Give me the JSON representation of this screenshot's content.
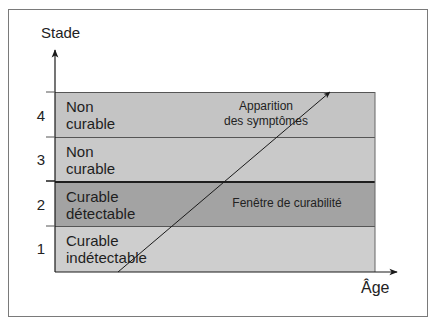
{
  "diagram": {
    "y_axis": {
      "title": "Stade",
      "ticks": [
        "4",
        "3",
        "2",
        "1"
      ]
    },
    "x_axis": {
      "title": "Âge"
    },
    "bands": [
      {
        "stage": "4",
        "line1": "Non",
        "line2": "curable",
        "color": "#c4c4c4"
      },
      {
        "stage": "3",
        "line1": "Non",
        "line2": "curable",
        "color": "#c8c8c8"
      },
      {
        "stage": "2",
        "line1": "Curable",
        "line2": "détectable",
        "color": "#a3a3a3"
      },
      {
        "stage": "1",
        "line1": "Curable",
        "line2": "indétectable",
        "color": "#cdcdcd"
      }
    ],
    "annotations": {
      "symptoms_line1": "Apparition",
      "symptoms_line2": "des symptômes",
      "window": "Fenêtre de curabilité"
    },
    "colors": {
      "frame": "#7a7a7a",
      "axis": "#1a1a1a",
      "band_border": "#2a2a2a"
    }
  }
}
